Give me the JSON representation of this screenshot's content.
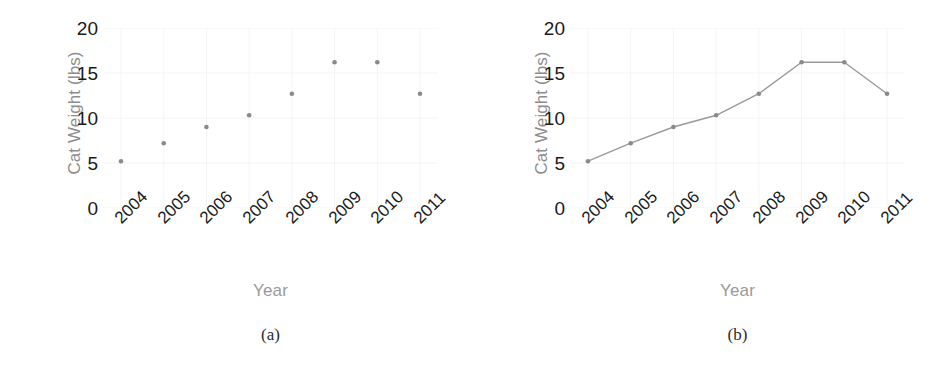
{
  "figure": {
    "background": "#ffffff",
    "marker_color": "#8a8a8a",
    "line_color": "#9a9a9a",
    "tick_text_color": "#1a1a1a",
    "axis_label_color": "#9a9a9a",
    "grid_color": "#f4f4f4"
  },
  "panels": [
    {
      "caption": "(a)",
      "chart": {
        "type": "scatter",
        "title": "",
        "xlabel": "Year",
        "ylabel": "Cat Weight (lbs)",
        "categories": [
          "2004",
          "2005",
          "2006",
          "2007",
          "2008",
          "2009",
          "2010",
          "2011"
        ],
        "x": [
          2004,
          2005,
          2006,
          2007,
          2008,
          2009,
          2010,
          2011
        ],
        "values": [
          5.2,
          7.2,
          9.0,
          10.3,
          12.7,
          16.2,
          16.2,
          12.7
        ],
        "yticks": [
          "0",
          "5",
          "10",
          "15",
          "20"
        ],
        "ytick_values": [
          0,
          5,
          10,
          15,
          20
        ],
        "ylim": [
          0,
          20
        ],
        "xlim": [
          2003.5,
          2011.5
        ],
        "grid": "faint",
        "legend": "none",
        "marker": "round-dot",
        "xtick_rotation_deg": -45
      }
    },
    {
      "caption": "(b)",
      "chart": {
        "type": "line",
        "title": "",
        "xlabel": "Year",
        "ylabel": "Cat Weight (lbs)",
        "categories": [
          "2004",
          "2005",
          "2006",
          "2007",
          "2008",
          "2009",
          "2010",
          "2011"
        ],
        "x": [
          2004,
          2005,
          2006,
          2007,
          2008,
          2009,
          2010,
          2011
        ],
        "values": [
          5.2,
          7.2,
          9.0,
          10.3,
          12.7,
          16.2,
          16.2,
          12.7
        ],
        "yticks": [
          "0",
          "5",
          "10",
          "15",
          "20"
        ],
        "ytick_values": [
          0,
          5,
          10,
          15,
          20
        ],
        "ylim": [
          0,
          20
        ],
        "xlim": [
          2003.5,
          2011.5
        ],
        "grid": "faint",
        "legend": "none",
        "marker": "round-dot",
        "xtick_rotation_deg": -45
      }
    }
  ],
  "chart_data": [
    {
      "type": "scatter",
      "title": "",
      "xlabel": "Year",
      "ylabel": "Cat Weight (lbs)",
      "categories": [
        "2004",
        "2005",
        "2006",
        "2007",
        "2008",
        "2009",
        "2010",
        "2011"
      ],
      "values": [
        5.2,
        7.2,
        9.0,
        10.3,
        12.7,
        16.2,
        16.2,
        12.7
      ],
      "ylim": [
        0,
        20
      ],
      "yticks": [
        0,
        5,
        10,
        15,
        20
      ],
      "grid": false,
      "legend": "none",
      "caption": "(a)"
    },
    {
      "type": "line",
      "title": "",
      "xlabel": "Year",
      "ylabel": "Cat Weight (lbs)",
      "categories": [
        "2004",
        "2005",
        "2006",
        "2007",
        "2008",
        "2009",
        "2010",
        "2011"
      ],
      "values": [
        5.2,
        7.2,
        9.0,
        10.3,
        12.7,
        16.2,
        16.2,
        12.7
      ],
      "ylim": [
        0,
        20
      ],
      "yticks": [
        0,
        5,
        10,
        15,
        20
      ],
      "grid": false,
      "legend": "none",
      "caption": "(b)"
    }
  ]
}
